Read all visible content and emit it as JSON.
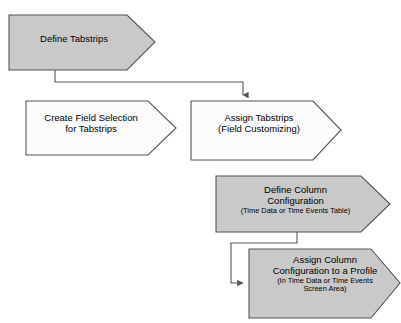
{
  "diagram": {
    "type": "flowchart",
    "background_color": "#ffffff",
    "shape_type": "chevron-arrow-pentagon",
    "colors": {
      "gray_fill": "#c9c9c9",
      "white_fill": "#fcfcfc",
      "stroke": "#555555",
      "text": "#000000",
      "connector": "#555555"
    },
    "nodes": [
      {
        "id": "define-tabstrips",
        "fill": "gray",
        "lines": [
          "Define Tabstrips"
        ],
        "sublines": []
      },
      {
        "id": "create-field-selection",
        "fill": "white",
        "lines": [
          "Create Field Selection",
          "for Tabstrips"
        ],
        "sublines": []
      },
      {
        "id": "assign-tabstrips",
        "fill": "white",
        "lines": [
          "Assign Tabstrips",
          "(Field Customizing)"
        ],
        "sublines": []
      },
      {
        "id": "define-column-configuration",
        "fill": "gray",
        "lines": [
          "Define Column",
          "Configuration"
        ],
        "sublines": [
          "(Time Data or Time Events Table)"
        ]
      },
      {
        "id": "assign-column-configuration",
        "fill": "gray",
        "lines": [
          "Assign Column",
          "Configuration to a Profile"
        ],
        "sublines": [
          "(In Time Data or Time Events",
          "Screen Area)"
        ]
      }
    ],
    "connectors": [
      {
        "id": "c1",
        "from": "define-tabstrips",
        "to": "assign-tabstrips",
        "style": "elbow-down-right-down",
        "arrow": "down"
      },
      {
        "id": "c2",
        "from": "define-column-configuration",
        "to": "assign-column-configuration",
        "style": "elbow-down-left-down-right",
        "arrow": "right"
      }
    ]
  }
}
